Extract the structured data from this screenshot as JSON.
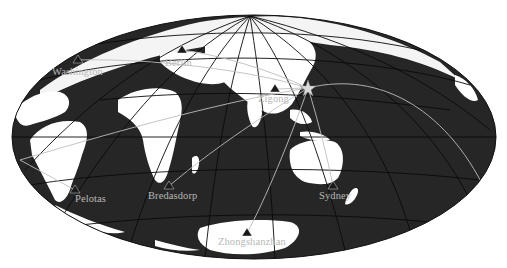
{
  "map": {
    "projection": "oblique equal-area (Hammer/Aitoff style)",
    "colors": {
      "ocean": "#262626",
      "land": "#ffffff",
      "graticule": "#0a0a0a",
      "path": "#bdbdbd",
      "station": "#1a1a1a",
      "epicenter": "#d9d9d9",
      "label": "#b8b8b8"
    },
    "epicenter": {
      "name": "epicenter-star",
      "x": 308,
      "y": 88
    },
    "stations": [
      {
        "name": "Washington",
        "x": 78,
        "y": 60,
        "lx": 52,
        "ly": 66
      },
      {
        "name": "Berlin",
        "x": 182,
        "y": 50,
        "lx": 165,
        "ly": 59
      },
      {
        "name": "Zigong",
        "x": 275,
        "y": 89,
        "lx": 258,
        "ly": 93
      },
      {
        "name": "Pelotas",
        "x": 75,
        "y": 190,
        "lx": 75,
        "ly": 193
      },
      {
        "name": "Bredasdorp",
        "x": 169,
        "y": 186,
        "lx": 148,
        "ly": 191
      },
      {
        "name": "Sydney",
        "x": 333,
        "y": 186,
        "lx": 319,
        "ly": 191
      },
      {
        "name": "Zhongshanzhan",
        "x": 247,
        "y": 233,
        "lx": 218,
        "ly": 237
      }
    ]
  }
}
